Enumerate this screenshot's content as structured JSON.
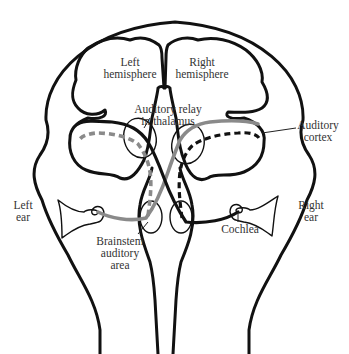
{
  "diagram": {
    "labels": {
      "left_hemisphere": [
        "Left",
        "hemisphere"
      ],
      "right_hemisphere": [
        "Right",
        "hemisphere"
      ],
      "auditory_relay": [
        "Auditory relay",
        "in thalamus"
      ],
      "auditory_cortex": [
        "Auditory",
        "cortex"
      ],
      "left_ear": [
        "Left",
        "ear"
      ],
      "right_ear": [
        "Right",
        "ear"
      ],
      "brainstem": [
        "Brainstem",
        "auditory",
        "area"
      ],
      "cochlea": [
        "Cochlea"
      ]
    },
    "pathways": [
      {
        "name": "right-ear-contralateral",
        "style": "solid",
        "color": "#111111"
      },
      {
        "name": "right-ear-ipsilateral",
        "style": "dashed",
        "color": "#111111"
      },
      {
        "name": "left-ear-contralateral",
        "style": "solid",
        "color": "#8a8a8a"
      },
      {
        "name": "left-ear-ipsilateral",
        "style": "dashed",
        "color": "#8a8a8a"
      }
    ]
  }
}
